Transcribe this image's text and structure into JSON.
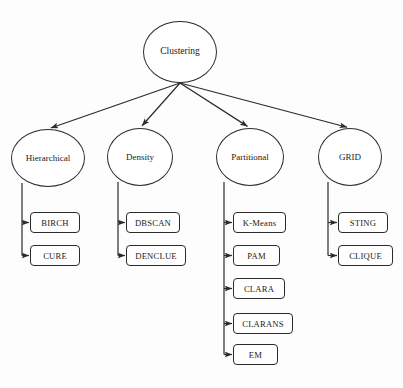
{
  "diagram": {
    "type": "tree",
    "title": "Clustering",
    "orientation": "top-down",
    "background_color": "#fdfdfd",
    "line_color": "#2b2b2b",
    "text_color": "#1a1a1a",
    "root": {
      "label": "Clustering",
      "shape": "ellipse",
      "cx": 180,
      "cy": 52,
      "rx": 37,
      "ry": 31
    },
    "fan_origin": {
      "x": 180,
      "y": 83
    },
    "branches": [
      {
        "id": "hierarchical",
        "label": "Hierarchical",
        "shape": "ellipse",
        "cx": 48,
        "cy": 158,
        "rx": 37,
        "ry": 29,
        "stem_x": 22,
        "leaves": [
          {
            "label": "BIRCH",
            "x": 30,
            "y": 212,
            "w": 50,
            "h": 21
          },
          {
            "label": "CURE",
            "x": 30,
            "y": 245,
            "w": 50,
            "h": 21
          }
        ]
      },
      {
        "id": "density",
        "label": "Density",
        "shape": "ellipse",
        "cx": 140,
        "cy": 157,
        "rx": 33,
        "ry": 29,
        "stem_x": 118,
        "leaves": [
          {
            "label": "DBSCAN",
            "x": 126,
            "y": 212,
            "w": 54,
            "h": 21
          },
          {
            "label": "DENCLUE",
            "x": 126,
            "y": 245,
            "w": 60,
            "h": 21
          }
        ]
      },
      {
        "id": "partitional",
        "label": "Partitional",
        "shape": "ellipse",
        "cx": 250,
        "cy": 157,
        "rx": 34,
        "ry": 29,
        "stem_x": 224,
        "leaves": [
          {
            "label": "K-Means",
            "x": 233,
            "y": 212,
            "w": 53,
            "h": 21
          },
          {
            "label": "PAM",
            "x": 233,
            "y": 245,
            "w": 47,
            "h": 21
          },
          {
            "label": "CLARA",
            "x": 233,
            "y": 278,
            "w": 52,
            "h": 21
          },
          {
            "label": "CLARANS",
            "x": 233,
            "y": 313,
            "w": 60,
            "h": 21
          },
          {
            "label": "EM",
            "x": 233,
            "y": 344,
            "w": 45,
            "h": 21
          }
        ]
      },
      {
        "id": "grid",
        "label": "GRID",
        "shape": "ellipse",
        "cx": 350,
        "cy": 157,
        "rx": 32,
        "ry": 29,
        "stem_x": 328,
        "leaves": [
          {
            "label": "STING",
            "x": 338,
            "y": 212,
            "w": 50,
            "h": 21
          },
          {
            "label": "CLIQUE",
            "x": 338,
            "y": 245,
            "w": 55,
            "h": 21
          }
        ]
      }
    ]
  }
}
